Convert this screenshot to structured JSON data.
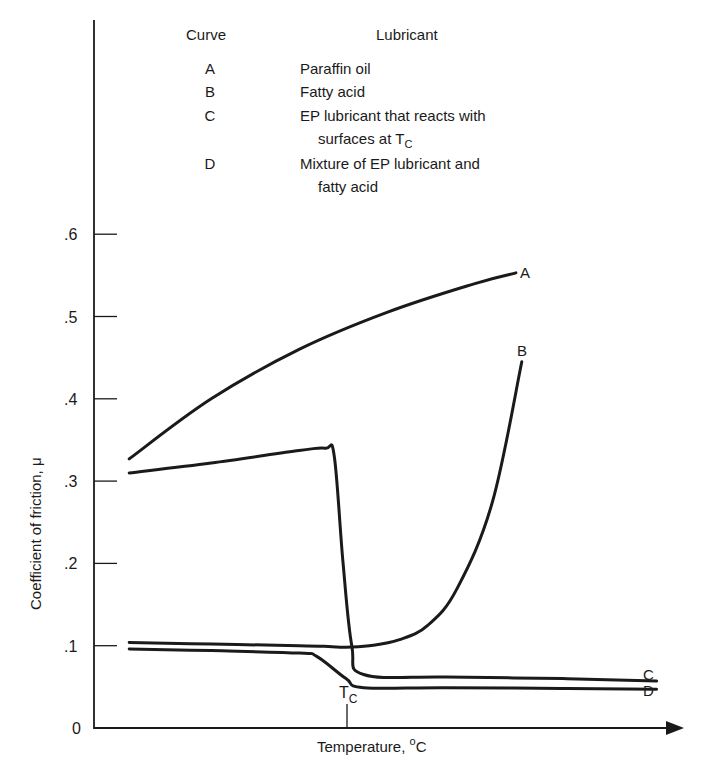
{
  "chart_data": {
    "type": "line",
    "title": "",
    "xlabel": "Temperature, °C",
    "ylabel": "Coefficient of friction, μ",
    "ylim": [
      0,
      0.65
    ],
    "xlim": [
      0,
      100
    ],
    "x_units": "relative temperature (no numeric ticks shown)",
    "y_ticks": [
      0,
      0.1,
      0.2,
      0.3,
      0.4,
      0.5,
      0.6
    ],
    "y_tick_labels": [
      "0",
      ".1",
      ".2",
      ".3",
      ".4",
      ".5",
      ".6"
    ],
    "x_markers": [
      {
        "label": "T_C",
        "x": 43
      }
    ],
    "grid": false,
    "legend_position": "top (table inside plot area)",
    "legend_header": [
      "Curve",
      "Lubricant"
    ],
    "series": [
      {
        "name": "A",
        "description": "Paraffin oil",
        "x": [
          6,
          20,
          35,
          50,
          65,
          72
        ],
        "y": [
          0.327,
          0.4,
          0.46,
          0.505,
          0.54,
          0.553
        ]
      },
      {
        "name": "B",
        "description": "Fatty acid",
        "x": [
          6,
          20,
          35,
          40,
          43,
          47,
          52,
          57,
          62,
          68,
          73
        ],
        "y": [
          0.104,
          0.102,
          0.1,
          0.099,
          0.098,
          0.1,
          0.107,
          0.125,
          0.17,
          0.275,
          0.445
        ]
      },
      {
        "name": "C",
        "description": "EP lubricant that reacts with surfaces at T_C",
        "x": [
          6,
          20,
          35,
          39.5,
          41,
          42.5,
          44,
          46,
          60,
          80,
          96
        ],
        "y": [
          0.31,
          0.322,
          0.337,
          0.34,
          0.33,
          0.2,
          0.1,
          0.065,
          0.062,
          0.06,
          0.057
        ]
      },
      {
        "name": "D",
        "description": "Mixture of EP lubricant and fatty acid",
        "x": [
          6,
          20,
          35,
          38,
          43,
          46,
          60,
          80,
          96
        ],
        "y": [
          0.096,
          0.094,
          0.091,
          0.087,
          0.06,
          0.049,
          0.049,
          0.048,
          0.047
        ]
      }
    ]
  },
  "legend": {
    "header_curve": "Curve",
    "header_lubricant": "Lubricant",
    "rows": [
      {
        "key": "A",
        "line1": "Paraffin oil",
        "line2": ""
      },
      {
        "key": "B",
        "line1": "Fatty acid",
        "line2": ""
      },
      {
        "key": "C",
        "line1": "EP lubricant that reacts with",
        "line2": "surfaces at T",
        "line2_sub": "C"
      },
      {
        "key": "D",
        "line1": "Mixture of EP lubricant and",
        "line2": "fatty acid"
      }
    ]
  },
  "axis": {
    "y_label": "Coefficient of friction, μ",
    "x_label_main": "Temperature, ",
    "x_label_sup": "o",
    "x_label_unit": "C",
    "tc_main": "T",
    "tc_sub": "C"
  }
}
